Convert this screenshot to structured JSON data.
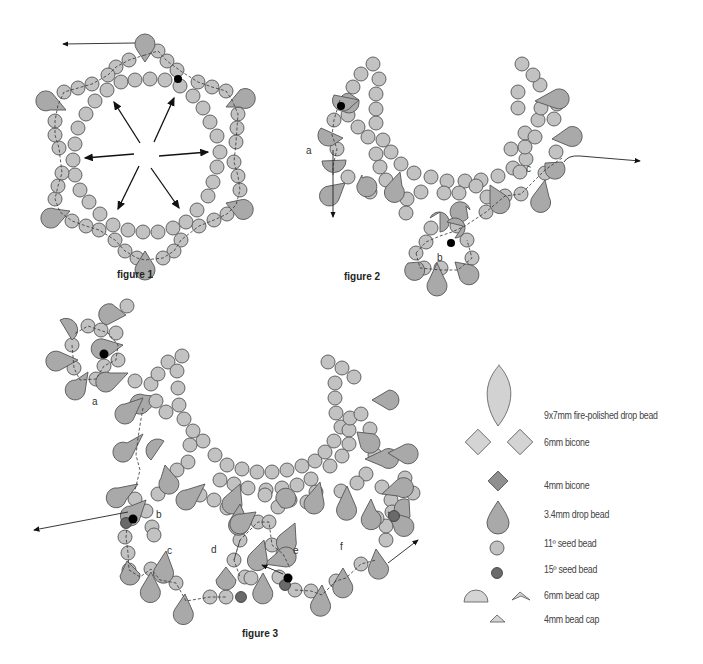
{
  "figures": {
    "figure1": {
      "label": "figure 1"
    },
    "figure2": {
      "label": "figure 2",
      "points": [
        "a",
        "b",
        "c"
      ]
    },
    "figure3": {
      "label": "figure 3",
      "points": [
        "a",
        "b",
        "c",
        "d",
        "e",
        "f"
      ]
    }
  },
  "legend": {
    "items": [
      {
        "label": "9x7mm fire-polished drop bead",
        "icon": "teardrop-large-icon"
      },
      {
        "label": "6mm bicone",
        "icon": "diamond-icon"
      },
      {
        "label": "4mm bicone",
        "icon": "diamond-small-dark-icon"
      },
      {
        "label": "3.4mm drop bead",
        "icon": "drop-icon"
      },
      {
        "label": "11º seed bead",
        "icon": "circle-icon"
      },
      {
        "label": "15º seed bead",
        "icon": "circle-small-dark-icon"
      },
      {
        "label": "6mm bead cap",
        "icon": "bead-cap-icon"
      },
      {
        "label": "4mm bead cap",
        "icon": "bead-cap-small-icon"
      }
    ]
  },
  "colors": {
    "seed": "#c2c2c2",
    "drop": "#a9a9a9",
    "seed15": "#6a6a6a",
    "outline": "#555555"
  }
}
